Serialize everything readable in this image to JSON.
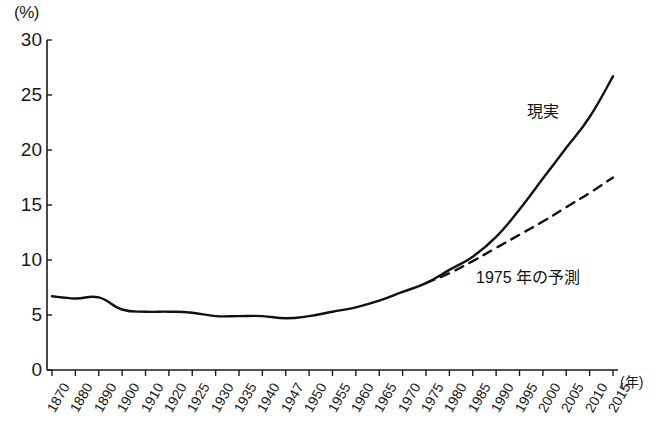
{
  "chart_data": {
    "type": "line",
    "title": "",
    "xlabel": "(年)",
    "ylabel": "(%)",
    "ylim": [
      0,
      30
    ],
    "yticks": [
      0,
      5,
      10,
      15,
      20,
      25,
      30
    ],
    "grid": false,
    "legend": "inline-annotations",
    "categories": [
      "1870",
      "1880",
      "1890",
      "1900",
      "1910",
      "1920",
      "1925",
      "1930",
      "1935",
      "1940",
      "1947",
      "1950",
      "1955",
      "1960",
      "1965",
      "1970",
      "1975",
      "1980",
      "1985",
      "1990",
      "1995",
      "2000",
      "2005",
      "2010",
      "2015"
    ],
    "series": [
      {
        "name": "現実",
        "style": "solid",
        "color": "#111111",
        "values": [
          6.7,
          6.5,
          6.6,
          5.5,
          5.3,
          5.3,
          5.2,
          4.9,
          4.9,
          4.9,
          4.7,
          4.9,
          5.3,
          5.7,
          6.3,
          7.1,
          7.9,
          9.1,
          10.3,
          12.1,
          14.6,
          17.4,
          20.2,
          23.0,
          26.7
        ]
      },
      {
        "name": "1975 年の予測",
        "style": "dashed",
        "color": "#111111",
        "x": [
          "1975",
          "1980",
          "1985",
          "1990",
          "1995",
          "2000",
          "2005",
          "2010",
          "2015"
        ],
        "values": [
          7.9,
          8.8,
          9.9,
          11.1,
          12.3,
          13.5,
          14.8,
          16.1,
          17.5
        ]
      }
    ],
    "annotations": [
      {
        "text": "現実",
        "x": "2000",
        "y": 22.5
      },
      {
        "text": "1975 年の予測",
        "x": "1990",
        "y": 8.0
      }
    ]
  },
  "axis": {
    "y_unit": "(%)",
    "x_unit": "(年)",
    "y_tick_labels": [
      "30",
      "25",
      "20",
      "15",
      "10",
      "5",
      "0"
    ],
    "x_tick_labels": [
      "1870",
      "1880",
      "1890",
      "1900",
      "1910",
      "1920",
      "1925",
      "1930",
      "1935",
      "1940",
      "1947",
      "1950",
      "1955",
      "1960",
      "1965",
      "1970",
      "1975",
      "1980",
      "1985",
      "1990",
      "1995",
      "2000",
      "2005",
      "2010",
      "2015"
    ]
  },
  "labels": {
    "series_real": "現実",
    "series_forecast": "1975 年の予測"
  }
}
